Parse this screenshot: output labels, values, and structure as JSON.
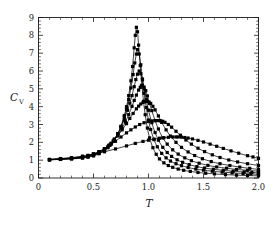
{
  "figure": {
    "background_color": "#ffffff",
    "line_color": "#000000",
    "text_color": "#1a1a1a"
  },
  "chart_data": {
    "type": "line",
    "title": "",
    "subtitle": "",
    "xlabel": "T",
    "ylabel": "C_V",
    "ylabel_base": "C",
    "ylabel_sub": "V",
    "xlim": [
      0,
      2.0
    ],
    "ylim": [
      0,
      9
    ],
    "xticks": [
      0,
      0.5,
      1.0,
      1.5,
      2.0
    ],
    "xtick_labels": [
      "0",
      "0.5",
      "1.0",
      "1.5",
      "2.0"
    ],
    "yticks": [
      0,
      1,
      2,
      3,
      4,
      5,
      6,
      7,
      8,
      9
    ],
    "ytick_labels": [
      "0",
      "1",
      "2",
      "3",
      "4",
      "5",
      "6",
      "7",
      "8",
      "9"
    ],
    "x_minor_step": 0.1,
    "y_minor_step": 0.2,
    "grid": false,
    "legend": false,
    "legend_position": "none",
    "marker": "square",
    "marker_size": 1.6,
    "frame": "box-all-sides-ticks-inward",
    "annotations": [],
    "series": [
      {
        "name": "curve-1-sharpest",
        "peak_x": 0.89,
        "peak_y": 8.45,
        "x": [
          0.1,
          0.2,
          0.3,
          0.4,
          0.45,
          0.5,
          0.55,
          0.6,
          0.63,
          0.66,
          0.69,
          0.72,
          0.75,
          0.78,
          0.8,
          0.82,
          0.84,
          0.855,
          0.87,
          0.88,
          0.89,
          0.9,
          0.91,
          0.925,
          0.94,
          0.955,
          0.97,
          0.99,
          1.01,
          1.04,
          1.07,
          1.1,
          1.14,
          1.18,
          1.22,
          1.27,
          1.32,
          1.38,
          1.45,
          1.52,
          1.6,
          1.7,
          1.8,
          1.9,
          2.0
        ],
        "y": [
          1.02,
          1.04,
          1.07,
          1.12,
          1.17,
          1.24,
          1.36,
          1.55,
          1.7,
          1.9,
          2.15,
          2.48,
          2.9,
          3.5,
          4.0,
          4.62,
          5.45,
          6.25,
          7.3,
          8.0,
          8.45,
          8.2,
          7.45,
          6.3,
          5.2,
          4.3,
          3.55,
          2.8,
          2.25,
          1.7,
          1.33,
          1.07,
          0.85,
          0.7,
          0.6,
          0.5,
          0.43,
          0.37,
          0.31,
          0.27,
          0.23,
          0.19,
          0.16,
          0.14,
          0.12
        ]
      },
      {
        "name": "curve-2",
        "peak_x": 0.9,
        "peak_y": 7.2,
        "x": [
          0.1,
          0.2,
          0.3,
          0.4,
          0.45,
          0.5,
          0.55,
          0.6,
          0.63,
          0.66,
          0.69,
          0.72,
          0.75,
          0.78,
          0.8,
          0.82,
          0.84,
          0.86,
          0.875,
          0.89,
          0.9,
          0.915,
          0.93,
          0.945,
          0.96,
          0.98,
          1.0,
          1.02,
          1.05,
          1.08,
          1.12,
          1.16,
          1.2,
          1.25,
          1.3,
          1.36,
          1.43,
          1.5,
          1.58,
          1.67,
          1.76,
          1.86,
          1.93,
          2.0
        ],
        "y": [
          1.02,
          1.05,
          1.08,
          1.13,
          1.19,
          1.26,
          1.38,
          1.57,
          1.72,
          1.92,
          2.17,
          2.48,
          2.88,
          3.42,
          3.85,
          4.4,
          5.05,
          5.8,
          6.45,
          6.95,
          7.2,
          6.95,
          6.35,
          5.55,
          4.75,
          3.95,
          3.25,
          2.72,
          2.15,
          1.75,
          1.38,
          1.13,
          0.95,
          0.8,
          0.69,
          0.59,
          0.5,
          0.44,
          0.38,
          0.33,
          0.29,
          0.25,
          0.23,
          0.21
        ]
      },
      {
        "name": "curve-3",
        "peak_x": 0.915,
        "peak_y": 6.0,
        "x": [
          0.1,
          0.2,
          0.3,
          0.4,
          0.45,
          0.5,
          0.55,
          0.6,
          0.63,
          0.66,
          0.69,
          0.72,
          0.75,
          0.78,
          0.81,
          0.83,
          0.85,
          0.87,
          0.885,
          0.9,
          0.915,
          0.93,
          0.945,
          0.96,
          0.98,
          1.0,
          1.03,
          1.06,
          1.09,
          1.13,
          1.17,
          1.21,
          1.26,
          1.31,
          1.37,
          1.44,
          1.51,
          1.59,
          1.68,
          1.77,
          1.87,
          1.94,
          2.0
        ],
        "y": [
          1.03,
          1.06,
          1.09,
          1.15,
          1.21,
          1.29,
          1.41,
          1.6,
          1.75,
          1.95,
          2.18,
          2.47,
          2.83,
          3.28,
          3.8,
          4.2,
          4.62,
          5.12,
          5.52,
          5.82,
          6.0,
          5.85,
          5.5,
          5.0,
          4.4,
          3.8,
          3.1,
          2.55,
          2.12,
          1.72,
          1.43,
          1.21,
          1.02,
          0.88,
          0.75,
          0.64,
          0.56,
          0.49,
          0.43,
          0.38,
          0.34,
          0.31,
          0.29
        ]
      },
      {
        "name": "curve-4",
        "peak_x": 0.945,
        "peak_y": 5.2,
        "x": [
          0.1,
          0.2,
          0.3,
          0.4,
          0.45,
          0.5,
          0.55,
          0.6,
          0.64,
          0.68,
          0.72,
          0.76,
          0.79,
          0.82,
          0.85,
          0.87,
          0.89,
          0.91,
          0.925,
          0.935,
          0.945,
          0.96,
          0.975,
          0.99,
          1.01,
          1.03,
          1.06,
          1.09,
          1.13,
          1.17,
          1.22,
          1.27,
          1.33,
          1.39,
          1.46,
          1.54,
          1.62,
          1.71,
          1.8,
          1.9,
          2.0
        ],
        "y": [
          1.03,
          1.06,
          1.1,
          1.16,
          1.23,
          1.31,
          1.44,
          1.62,
          1.82,
          2.06,
          2.38,
          2.78,
          3.15,
          3.55,
          4.02,
          4.35,
          4.65,
          4.93,
          5.08,
          5.16,
          5.2,
          5.1,
          4.9,
          4.6,
          4.18,
          3.78,
          3.22,
          2.75,
          2.25,
          1.9,
          1.58,
          1.34,
          1.13,
          0.97,
          0.83,
          0.71,
          0.62,
          0.55,
          0.48,
          0.43,
          0.38
        ]
      },
      {
        "name": "curve-5",
        "peak_x": 0.99,
        "peak_y": 4.3,
        "x": [
          0.1,
          0.2,
          0.3,
          0.4,
          0.45,
          0.5,
          0.55,
          0.6,
          0.64,
          0.68,
          0.72,
          0.76,
          0.8,
          0.83,
          0.86,
          0.89,
          0.91,
          0.93,
          0.95,
          0.965,
          0.98,
          0.99,
          1.005,
          1.02,
          1.04,
          1.06,
          1.09,
          1.12,
          1.16,
          1.2,
          1.25,
          1.3,
          1.36,
          1.42,
          1.49,
          1.57,
          1.65,
          1.74,
          1.83,
          1.92,
          2.0
        ],
        "y": [
          1.03,
          1.07,
          1.11,
          1.18,
          1.25,
          1.34,
          1.47,
          1.65,
          1.84,
          2.08,
          2.36,
          2.7,
          3.05,
          3.34,
          3.62,
          3.88,
          4.03,
          4.15,
          4.24,
          4.28,
          4.3,
          4.3,
          4.26,
          4.18,
          4.02,
          3.82,
          3.48,
          3.12,
          2.7,
          2.35,
          2.0,
          1.72,
          1.46,
          1.26,
          1.08,
          0.92,
          0.8,
          0.7,
          0.61,
          0.54,
          0.48
        ]
      },
      {
        "name": "curve-6",
        "peak_x": 1.11,
        "peak_y": 3.22,
        "x": [
          0.1,
          0.2,
          0.3,
          0.4,
          0.45,
          0.5,
          0.55,
          0.6,
          0.65,
          0.7,
          0.75,
          0.8,
          0.84,
          0.88,
          0.92,
          0.96,
          1.0,
          1.03,
          1.06,
          1.08,
          1.1,
          1.11,
          1.13,
          1.15,
          1.18,
          1.21,
          1.25,
          1.29,
          1.34,
          1.39,
          1.45,
          1.51,
          1.58,
          1.65,
          1.73,
          1.81,
          1.9,
          2.0
        ],
        "y": [
          1.04,
          1.08,
          1.13,
          1.21,
          1.27,
          1.36,
          1.48,
          1.64,
          1.84,
          2.06,
          2.3,
          2.53,
          2.7,
          2.86,
          3.0,
          3.1,
          3.17,
          3.2,
          3.22,
          3.22,
          3.22,
          3.21,
          3.18,
          3.12,
          3.0,
          2.85,
          2.62,
          2.4,
          2.13,
          1.9,
          1.67,
          1.48,
          1.3,
          1.15,
          1.01,
          0.9,
          0.8,
          0.7
        ]
      },
      {
        "name": "curve-7-broadest",
        "peak_x": 1.27,
        "peak_y": 2.3,
        "x": [
          0.1,
          0.2,
          0.3,
          0.4,
          0.5,
          0.6,
          0.7,
          0.8,
          0.88,
          0.95,
          1.0,
          1.05,
          1.1,
          1.14,
          1.18,
          1.22,
          1.25,
          1.27,
          1.3,
          1.33,
          1.36,
          1.4,
          1.45,
          1.5,
          1.56,
          1.62,
          1.68,
          1.75,
          1.82,
          1.9,
          1.95,
          2.0
        ],
        "y": [
          1.04,
          1.09,
          1.14,
          1.22,
          1.33,
          1.47,
          1.63,
          1.8,
          1.94,
          2.05,
          2.12,
          2.18,
          2.23,
          2.26,
          2.28,
          2.3,
          2.3,
          2.3,
          2.29,
          2.27,
          2.24,
          2.19,
          2.11,
          2.02,
          1.9,
          1.78,
          1.66,
          1.52,
          1.39,
          1.25,
          1.18,
          1.1
        ]
      }
    ]
  }
}
